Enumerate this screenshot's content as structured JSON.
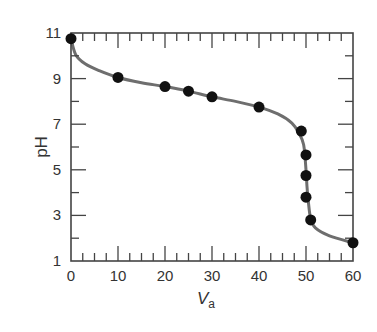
{
  "chart_data": {
    "type": "line",
    "title": "",
    "xlabel": "V_a",
    "xlabel_main": "V",
    "xlabel_sub": "a",
    "ylabel": "pH",
    "xlim": [
      0,
      60
    ],
    "ylim": [
      1,
      11
    ],
    "x_ticks": [
      0,
      10,
      20,
      30,
      40,
      50,
      60
    ],
    "y_ticks": [
      1,
      3,
      5,
      7,
      9,
      11
    ],
    "x_minor_step": 2.5,
    "y_minor_step": 1,
    "grid": false,
    "legend": null,
    "series": [
      {
        "name": "data points",
        "type": "scatter",
        "x": [
          0,
          10,
          20,
          25,
          30,
          40,
          49,
          50,
          50,
          50,
          51,
          60
        ],
        "y": [
          10.75,
          9.05,
          8.65,
          8.45,
          8.2,
          7.75,
          6.7,
          5.65,
          4.75,
          3.8,
          2.8,
          1.8
        ]
      },
      {
        "name": "titration curve",
        "type": "line",
        "x": [
          0,
          1,
          3,
          6,
          10,
          15,
          20,
          25,
          30,
          35,
          40,
          44,
          47,
          48.5,
          49.5,
          50,
          50.2,
          50.5,
          51,
          52,
          55,
          60
        ],
        "y": [
          10.75,
          10.05,
          9.65,
          9.35,
          9.05,
          8.82,
          8.65,
          8.45,
          8.2,
          8.0,
          7.75,
          7.45,
          7.05,
          6.6,
          6.1,
          5.0,
          4.3,
          3.6,
          2.85,
          2.45,
          2.1,
          1.8
        ]
      }
    ]
  }
}
